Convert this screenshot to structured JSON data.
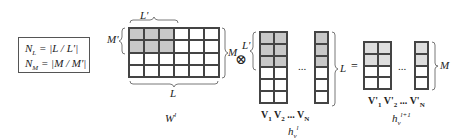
{
  "formulas": {
    "nl": "N_L = |L / L'|",
    "nm": "N_M = |M / M'|",
    "nl_lhs": "N",
    "nl_sub": "L",
    "nl_rhs": " = |L / L'|",
    "nm_lhs": "N",
    "nm_sub": "M",
    "nm_rhs": " = |M / M'|"
  },
  "weight_matrix": {
    "name": "W",
    "sup": "l",
    "rows": 4,
    "cols": 6,
    "shaded_rows": 2,
    "shaded_cols": 3,
    "brace_top": "L'",
    "brace_left": "M'",
    "brace_right": "M",
    "brace_bottom": "L"
  },
  "operator": "⊗",
  "input_matrix": {
    "name": "h",
    "sub": "v",
    "sup": "l",
    "rows": 6,
    "shaded_rows": 3,
    "brace_left": "L'",
    "brace_right": "L",
    "ellipsis": "...",
    "columns": [
      "V1",
      "V2",
      "...",
      "VN"
    ]
  },
  "equals": "=",
  "output_matrix": {
    "name": "h",
    "sub": "v",
    "sup": "l+1",
    "rows": 4,
    "shaded_rows": 2,
    "brace_right": "M",
    "ellipsis": "...",
    "columns": [
      "V'1",
      "V'2",
      "...",
      "V'N"
    ]
  },
  "colors": {
    "shade_dark": "#c8c8c8",
    "shade_light": "#dedede",
    "line": "#444444"
  }
}
